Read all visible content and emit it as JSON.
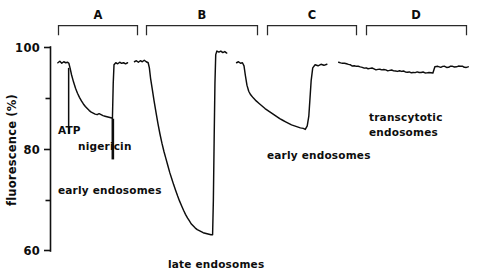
{
  "figure": {
    "background_color": "#ffffff",
    "ink_color": "#0d0d0d"
  },
  "axis": {
    "y_title": "fluorescence (%)",
    "tick_labels": [
      "100",
      "80",
      "60"
    ],
    "tick_100": "100",
    "tick_80": "80",
    "tick_60": "60"
  },
  "brackets": {
    "a": "A",
    "b": "B",
    "c": "C",
    "d": "D"
  },
  "annotations": {
    "atp": "ATP",
    "nigericin": "nigericin",
    "early_endosomes_a": "early endosomes",
    "late_endosomes_b": "late endosomes",
    "early_endosomes_c": "early endosomes",
    "transcytotic_line1": "transcytotic",
    "transcytotic_line2": "endosomes"
  },
  "chart_data": {
    "type": "line",
    "title": "",
    "xlabel": "",
    "ylabel": "fluorescence (%)",
    "ylim": [
      60,
      100
    ],
    "y_ticks_major": [
      100,
      80,
      60
    ],
    "y_ticks_minor": [
      90,
      70
    ],
    "grid": false,
    "legend": "none",
    "x_axis_visible": false,
    "panel_labels": [
      "A",
      "B",
      "C",
      "D"
    ],
    "series": [
      {
        "name": "A",
        "label": "early endosomes",
        "panel": "A",
        "description": "Baseline ~97%, ATP addition triggers exponential acidification decay to ~86%, nigericin addition restores fluorescence to ~97%.",
        "markers": [
          {
            "name": "ATP",
            "x": 17.5,
            "y_top": 96.0,
            "y_bottom": 83.0
          },
          {
            "name": "nigericin",
            "x": 40.0,
            "y_top": 86.0,
            "y_bottom": 78.0
          }
        ],
        "points": [
          [
            12.0,
            97.0
          ],
          [
            13.0,
            97.3
          ],
          [
            14.0,
            96.9
          ],
          [
            15.0,
            97.2
          ],
          [
            16.0,
            97.0
          ],
          [
            17.0,
            97.1
          ],
          [
            17.6,
            96.9
          ],
          [
            18.2,
            96.0
          ],
          [
            19.0,
            94.6
          ],
          [
            20.0,
            93.2
          ],
          [
            21.0,
            92.0
          ],
          [
            22.0,
            91.0
          ],
          [
            23.0,
            90.2
          ],
          [
            24.0,
            89.5
          ],
          [
            25.0,
            88.9
          ],
          [
            26.0,
            88.4
          ],
          [
            27.0,
            88.0
          ],
          [
            28.0,
            87.6
          ],
          [
            29.0,
            87.3
          ],
          [
            30.0,
            87.1
          ],
          [
            31.0,
            86.9
          ],
          [
            32.0,
            86.8
          ],
          [
            33.0,
            87.0
          ],
          [
            34.0,
            86.8
          ],
          [
            35.0,
            86.6
          ],
          [
            36.0,
            86.5
          ],
          [
            37.0,
            86.4
          ],
          [
            38.0,
            86.3
          ],
          [
            39.0,
            86.2
          ],
          [
            39.8,
            86.1
          ],
          [
            40.2,
            93.0
          ],
          [
            40.6,
            96.6
          ],
          [
            41.5,
            97.0
          ],
          [
            42.5,
            96.8
          ],
          [
            43.5,
            97.1
          ],
          [
            44.5,
            96.9
          ],
          [
            45.5,
            97.0
          ],
          [
            46.5,
            96.8
          ],
          [
            47.5,
            97.0
          ]
        ]
      },
      {
        "name": "B",
        "label": "late endosomes",
        "panel": "B",
        "description": "Baseline ~97%, large sustained acidification to ~63%, then sharp recovery spike back to ~99%.",
        "markers": [],
        "points": [
          [
            51.0,
            97.2
          ],
          [
            52.0,
            97.4
          ],
          [
            53.0,
            97.1
          ],
          [
            54.0,
            97.4
          ],
          [
            55.0,
            97.2
          ],
          [
            56.0,
            97.5
          ],
          [
            57.0,
            97.2
          ],
          [
            58.0,
            97.0
          ],
          [
            58.6,
            96.0
          ],
          [
            59.2,
            94.0
          ],
          [
            60.0,
            92.0
          ],
          [
            61.0,
            89.5
          ],
          [
            62.0,
            87.2
          ],
          [
            63.0,
            85.0
          ],
          [
            64.0,
            83.0
          ],
          [
            65.0,
            81.2
          ],
          [
            66.0,
            79.6
          ],
          [
            67.0,
            78.2
          ],
          [
            68.0,
            76.8
          ],
          [
            69.0,
            75.4
          ],
          [
            70.0,
            74.2
          ],
          [
            71.0,
            73.0
          ],
          [
            72.0,
            71.9
          ],
          [
            73.0,
            70.8
          ],
          [
            74.0,
            69.8
          ],
          [
            75.0,
            68.9
          ],
          [
            76.0,
            68.0
          ],
          [
            77.0,
            67.2
          ],
          [
            78.0,
            66.5
          ],
          [
            79.0,
            65.9
          ],
          [
            80.0,
            65.3
          ],
          [
            81.0,
            64.9
          ],
          [
            82.0,
            64.5
          ],
          [
            83.0,
            64.2
          ],
          [
            84.0,
            64.0
          ],
          [
            85.0,
            63.8
          ],
          [
            86.0,
            63.6
          ],
          [
            87.0,
            63.5
          ],
          [
            88.0,
            63.4
          ],
          [
            89.0,
            63.3
          ],
          [
            90.0,
            63.2
          ],
          [
            90.8,
            63.2
          ],
          [
            91.2,
            70.0
          ],
          [
            91.6,
            82.0
          ],
          [
            92.0,
            93.0
          ],
          [
            92.4,
            98.6
          ],
          [
            93.0,
            99.3
          ],
          [
            94.0,
            99.1
          ],
          [
            95.0,
            99.3
          ],
          [
            96.0,
            99.0
          ],
          [
            97.0,
            99.2
          ],
          [
            98.0,
            98.9
          ]
        ]
      },
      {
        "name": "C",
        "label": "early endosomes",
        "panel": "C",
        "description": "Baseline ~97%, moderate gradual acidification to ~84%, then rapid recovery to ~96.5%.",
        "markers": [],
        "points": [
          [
            103.0,
            97.0
          ],
          [
            104.0,
            97.2
          ],
          [
            105.0,
            96.9
          ],
          [
            106.0,
            97.0
          ],
          [
            106.8,
            96.4
          ],
          [
            107.5,
            94.5
          ],
          [
            108.3,
            92.6
          ],
          [
            109.2,
            91.4
          ],
          [
            110.2,
            90.7
          ],
          [
            111.5,
            90.1
          ],
          [
            113.0,
            89.5
          ],
          [
            114.5,
            89.0
          ],
          [
            116.0,
            88.5
          ],
          [
            117.5,
            88.0
          ],
          [
            119.0,
            87.6
          ],
          [
            120.5,
            87.2
          ],
          [
            122.0,
            86.8
          ],
          [
            123.5,
            86.4
          ],
          [
            125.0,
            86.0
          ],
          [
            126.5,
            85.7
          ],
          [
            128.0,
            85.4
          ],
          [
            129.5,
            85.1
          ],
          [
            131.0,
            84.8
          ],
          [
            132.5,
            84.6
          ],
          [
            134.0,
            84.4
          ],
          [
            135.5,
            84.2
          ],
          [
            137.0,
            84.1
          ],
          [
            138.0,
            83.9
          ],
          [
            139.0,
            84.6
          ],
          [
            139.8,
            86.5
          ],
          [
            140.4,
            90.0
          ],
          [
            141.0,
            93.5
          ],
          [
            141.8,
            96.0
          ],
          [
            143.0,
            96.6
          ],
          [
            144.5,
            96.4
          ],
          [
            146.0,
            96.7
          ],
          [
            147.5,
            96.5
          ],
          [
            149.0,
            96.7
          ]
        ]
      },
      {
        "name": "D",
        "label": "transcytotic endosomes",
        "panel": "D",
        "description": "Essentially flat near 97%, slight drift down to ~95%, small step back up to ~96%.",
        "markers": [],
        "points": [
          [
            155.0,
            97.1
          ],
          [
            157.0,
            96.9
          ],
          [
            159.0,
            96.8
          ],
          [
            161.0,
            96.6
          ],
          [
            163.0,
            96.4
          ],
          [
            165.0,
            96.3
          ],
          [
            167.0,
            96.1
          ],
          [
            169.0,
            96.0
          ],
          [
            171.0,
            95.9
          ],
          [
            173.0,
            95.8
          ],
          [
            175.0,
            95.7
          ],
          [
            177.0,
            95.6
          ],
          [
            179.0,
            95.6
          ],
          [
            181.0,
            95.5
          ],
          [
            183.0,
            95.4
          ],
          [
            185.0,
            95.3
          ],
          [
            187.0,
            95.3
          ],
          [
            189.0,
            95.2
          ],
          [
            191.0,
            95.2
          ],
          [
            193.0,
            95.1
          ],
          [
            195.0,
            95.2
          ],
          [
            197.0,
            95.1
          ],
          [
            199.0,
            95.0
          ],
          [
            201.0,
            95.1
          ],
          [
            203.0,
            95.0
          ],
          [
            204.0,
            96.2
          ],
          [
            205.5,
            96.3
          ],
          [
            207.0,
            96.1
          ],
          [
            209.0,
            96.3
          ],
          [
            211.0,
            96.1
          ],
          [
            213.0,
            96.3
          ],
          [
            215.0,
            96.2
          ],
          [
            217.0,
            96.3
          ],
          [
            219.0,
            96.1
          ],
          [
            221.0,
            96.2
          ]
        ]
      }
    ]
  }
}
